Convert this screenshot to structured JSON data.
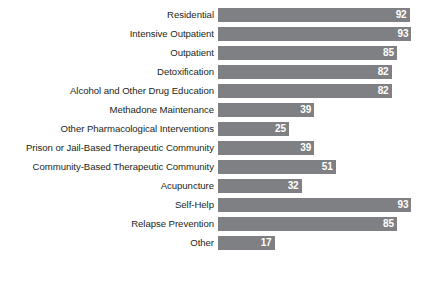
{
  "chart_data": {
    "type": "bar",
    "orientation": "horizontal",
    "title": "",
    "subtitle": "",
    "xlabel": "",
    "ylabel": "",
    "xlim": [
      0,
      100
    ],
    "grid": false,
    "legend": null,
    "bar_color": "#7f8083",
    "value_label_color": "#ffffff",
    "background_color": "#ffffff",
    "categories": [
      "Residential",
      "Intensive Outpatient",
      "Outpatient",
      "Detoxification",
      "Alcohol and Other Drug Education",
      "Methadone Maintenance",
      "Other Pharmacological Interventions",
      "Prison or Jail-Based Therapeutic Community",
      "Community-Based Therapeutic Community",
      "Acupuncture",
      "Self-Help",
      "Relapse Prevention",
      "Other"
    ],
    "values": [
      92,
      93,
      85,
      82,
      82,
      39,
      25,
      39,
      51,
      32,
      93,
      85,
      17
    ]
  },
  "cropped_text": {
    "top": "",
    "bottom": ""
  }
}
